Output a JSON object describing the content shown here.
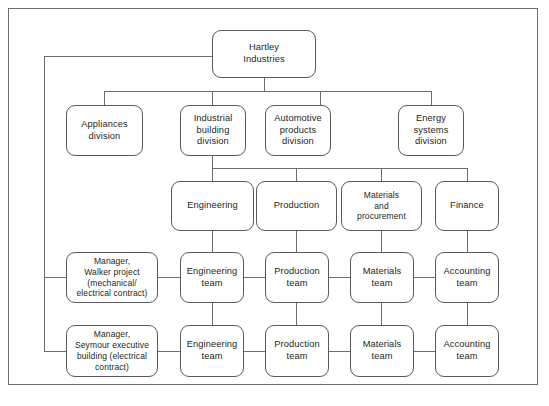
{
  "diagram": {
    "type": "organizational-chart",
    "title_node": "Hartley\nIndustries",
    "colors": {
      "box_border": "#58595b",
      "connector": "#6d6e71",
      "frame": "#6d6e71",
      "background": "#ffffff",
      "text": "#231f20"
    },
    "levels": {
      "level1": {
        "label": "company",
        "nodes": [
          {
            "id": "hartley",
            "text": "Hartley\nIndustries"
          }
        ]
      },
      "level2": {
        "label": "divisions",
        "nodes": [
          {
            "id": "appliances",
            "text": "Appliances\ndivision"
          },
          {
            "id": "industrial",
            "text": "Industrial\nbuilding\ndivision"
          },
          {
            "id": "automotive",
            "text": "Automotive\nproducts\ndivision"
          },
          {
            "id": "energy",
            "text": "Energy\nsystems\ndivision"
          }
        ]
      },
      "level3": {
        "label": "functions",
        "nodes": [
          {
            "id": "engineering",
            "text": "Engineering"
          },
          {
            "id": "production",
            "text": "Production"
          },
          {
            "id": "materials",
            "text": "Materials\nand\nprocurement"
          },
          {
            "id": "finance",
            "text": "Finance"
          }
        ]
      },
      "level4": {
        "label": "project-walker",
        "manager": {
          "id": "mgr-walker",
          "text": "Manager,\nWalker project\n(mechanical/\nelectrical contract)"
        },
        "nodes": [
          {
            "id": "eng-team-1",
            "text": "Engineering\nteam"
          },
          {
            "id": "prod-team-1",
            "text": "Production\nteam"
          },
          {
            "id": "mat-team-1",
            "text": "Materials\nteam"
          },
          {
            "id": "acct-team-1",
            "text": "Accounting\nteam"
          }
        ]
      },
      "level5": {
        "label": "project-seymour",
        "manager": {
          "id": "mgr-seymour",
          "text": "Manager,\nSeymour executive\nbuilding (electrical\ncontract)"
        },
        "nodes": [
          {
            "id": "eng-team-2",
            "text": "Engineering\nteam"
          },
          {
            "id": "prod-team-2",
            "text": "Production\nteam"
          },
          {
            "id": "mat-team-2",
            "text": "Materials\nteam"
          },
          {
            "id": "acct-team-2",
            "text": "Accounting\nteam"
          }
        ]
      }
    }
  }
}
